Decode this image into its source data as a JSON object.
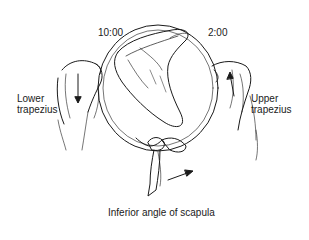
{
  "figure": {
    "labels": {
      "left_clock": "10:00",
      "right_clock": "2:00",
      "left_muscle_line1": "Lower",
      "left_muscle_line2": "trapezius",
      "right_muscle_line1": "Upper",
      "right_muscle_line2": "trapezius",
      "caption": "Inferior angle of scapula"
    },
    "colors": {
      "ink": "#1a1a1a",
      "background": "#ffffff"
    }
  }
}
